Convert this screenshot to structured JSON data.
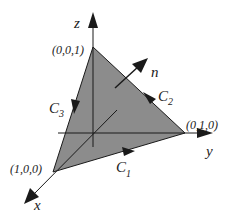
{
  "figure": {
    "colors": {
      "surface_fill": "#8c8c8c",
      "stroke": "#1a1a1a",
      "background": "#ffffff"
    },
    "axes": {
      "x_label": "x",
      "y_label": "y",
      "z_label": "z"
    },
    "vertices": {
      "x_vertex": "(1,0,0)",
      "y_vertex": "(0,1,0)",
      "z_vertex": "(0,0,1)"
    },
    "curves": {
      "c1": "C",
      "c1_sub": "1",
      "c2": "C",
      "c2_sub": "2",
      "c3": "C",
      "c3_sub": "3"
    },
    "normal_label": "n"
  }
}
